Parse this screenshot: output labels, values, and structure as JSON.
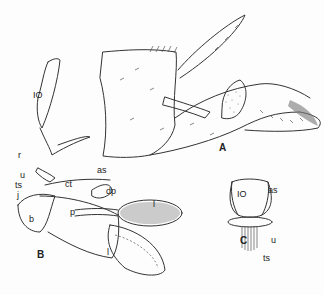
{
  "figure": {
    "panels": [
      {
        "id": "A",
        "label": "A"
      },
      {
        "id": "B",
        "label": "B"
      },
      {
        "id": "C",
        "label": "C"
      }
    ],
    "labels_B": {
      "io": "IO",
      "r": "r",
      "as": "as",
      "u": "u",
      "ts": "ts",
      "ct": "ct",
      "j": "j",
      "dp": "dp",
      "b": "b",
      "p": "p",
      "l_upper": "l",
      "l_lower": "l"
    },
    "labels_C": {
      "io": "IO",
      "as": "as",
      "u": "u",
      "ts": "ts"
    }
  }
}
